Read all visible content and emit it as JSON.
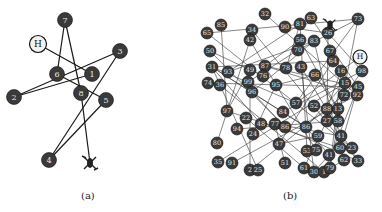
{
  "panels": [
    {
      "id": "a",
      "caption": "(a)",
      "home": {
        "label": "H",
        "x": 38,
        "y": 44
      },
      "drone": {
        "x": 90,
        "y": 163
      },
      "nodes": [
        {
          "label": "7",
          "x": 65,
          "y": 20
        },
        {
          "label": "3",
          "x": 120,
          "y": 51
        },
        {
          "label": "6",
          "x": 57,
          "y": 74
        },
        {
          "label": "1",
          "x": 92,
          "y": 74
        },
        {
          "label": "2",
          "x": 14,
          "y": 97
        },
        {
          "label": "8",
          "x": 81,
          "y": 93
        },
        {
          "label": "5",
          "x": 106,
          "y": 100
        },
        {
          "label": "4",
          "x": 49,
          "y": 160
        }
      ],
      "edges": [
        [
          "7",
          "6"
        ],
        [
          "7",
          "8"
        ],
        [
          "H",
          "1"
        ],
        [
          "3",
          "2"
        ],
        [
          "1",
          "2"
        ],
        [
          "6",
          "5"
        ],
        [
          "3",
          "4"
        ],
        [
          "5",
          "4"
        ],
        [
          "8",
          "drone"
        ]
      ]
    },
    {
      "id": "b",
      "caption": "(b)",
      "home": {
        "label": "H",
        "x": 360,
        "y": 57
      },
      "drone": {
        "x": 330,
        "y": 25
      },
      "nodes": [
        {
          "label": "32",
          "x": 265,
          "y": 14
        },
        {
          "label": "85",
          "x": 221,
          "y": 25
        },
        {
          "label": "90",
          "x": 285,
          "y": 27
        },
        {
          "label": "81",
          "x": 300,
          "y": 24
        },
        {
          "label": "63",
          "x": 311,
          "y": 18
        },
        {
          "label": "73",
          "x": 358,
          "y": 19
        },
        {
          "label": "65",
          "x": 207,
          "y": 33
        },
        {
          "label": "34",
          "x": 252,
          "y": 30
        },
        {
          "label": "26",
          "x": 328,
          "y": 33
        },
        {
          "label": "42",
          "x": 250,
          "y": 40
        },
        {
          "label": "56",
          "x": 300,
          "y": 40
        },
        {
          "label": "83",
          "x": 314,
          "y": 41
        },
        {
          "label": "50",
          "x": 210,
          "y": 51
        },
        {
          "label": "70",
          "x": 298,
          "y": 50
        },
        {
          "label": "67",
          "x": 330,
          "y": 51
        },
        {
          "label": "64",
          "x": 333,
          "y": 61
        },
        {
          "label": "31",
          "x": 212,
          "y": 67
        },
        {
          "label": "93",
          "x": 228,
          "y": 72
        },
        {
          "label": "49",
          "x": 250,
          "y": 70
        },
        {
          "label": "87",
          "x": 265,
          "y": 66
        },
        {
          "label": "76",
          "x": 263,
          "y": 76
        },
        {
          "label": "78",
          "x": 286,
          "y": 68
        },
        {
          "label": "43",
          "x": 301,
          "y": 67
        },
        {
          "label": "16",
          "x": 341,
          "y": 71
        },
        {
          "label": "98",
          "x": 362,
          "y": 71
        },
        {
          "label": "74",
          "x": 208,
          "y": 83
        },
        {
          "label": "36",
          "x": 220,
          "y": 85
        },
        {
          "label": "99",
          "x": 248,
          "y": 82
        },
        {
          "label": "95",
          "x": 276,
          "y": 85
        },
        {
          "label": "66",
          "x": 315,
          "y": 75
        },
        {
          "label": "15",
          "x": 345,
          "y": 83
        },
        {
          "label": "45",
          "x": 358,
          "y": 87
        },
        {
          "label": "96",
          "x": 252,
          "y": 92
        },
        {
          "label": "72",
          "x": 344,
          "y": 95
        },
        {
          "label": "92",
          "x": 357,
          "y": 95
        },
        {
          "label": "57",
          "x": 296,
          "y": 103
        },
        {
          "label": "52",
          "x": 314,
          "y": 106
        },
        {
          "label": "88",
          "x": 327,
          "y": 109
        },
        {
          "label": "13",
          "x": 338,
          "y": 109
        },
        {
          "label": "97",
          "x": 227,
          "y": 111
        },
        {
          "label": "84",
          "x": 283,
          "y": 112
        },
        {
          "label": "27",
          "x": 327,
          "y": 121
        },
        {
          "label": "58",
          "x": 338,
          "y": 121
        },
        {
          "label": "22",
          "x": 246,
          "y": 118
        },
        {
          "label": "48",
          "x": 261,
          "y": 124
        },
        {
          "label": "77",
          "x": 275,
          "y": 124
        },
        {
          "label": "86",
          "x": 285,
          "y": 127
        },
        {
          "label": "86b",
          "display": "86",
          "x": 306,
          "y": 127
        },
        {
          "label": "94",
          "x": 237,
          "y": 129
        },
        {
          "label": "24",
          "x": 253,
          "y": 134
        },
        {
          "label": "59",
          "x": 318,
          "y": 136
        },
        {
          "label": "41",
          "x": 341,
          "y": 136
        },
        {
          "label": "80",
          "x": 217,
          "y": 143
        },
        {
          "label": "47",
          "x": 279,
          "y": 144
        },
        {
          "label": "60",
          "x": 340,
          "y": 148
        },
        {
          "label": "23",
          "x": 352,
          "y": 148
        },
        {
          "label": "53",
          "x": 307,
          "y": 151
        },
        {
          "label": "75",
          "x": 316,
          "y": 150
        },
        {
          "label": "41b",
          "display": "41",
          "x": 329,
          "y": 155
        },
        {
          "label": "51",
          "x": 285,
          "y": 163
        },
        {
          "label": "62",
          "x": 344,
          "y": 160
        },
        {
          "label": "33",
          "x": 358,
          "y": 161
        },
        {
          "label": "35",
          "x": 218,
          "y": 162
        },
        {
          "label": "91",
          "x": 232,
          "y": 163
        },
        {
          "label": "61",
          "x": 304,
          "y": 168
        },
        {
          "label": "30",
          "x": 314,
          "y": 172
        },
        {
          "label": "1",
          "x": 324,
          "y": 172
        },
        {
          "label": "79",
          "x": 330,
          "y": 168
        },
        {
          "label": "2",
          "x": 250,
          "y": 170
        },
        {
          "label": "25",
          "x": 258,
          "y": 170
        }
      ]
    }
  ]
}
